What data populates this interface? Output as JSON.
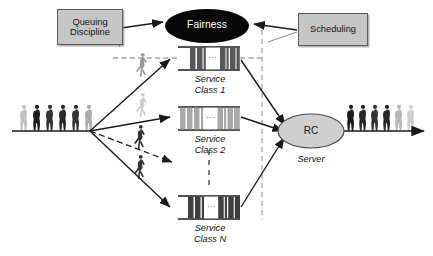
{
  "figure": {
    "title_visible": false,
    "width": 433,
    "height": 256,
    "background": "#ffffff"
  },
  "controls": [
    {
      "id": "queuing-discipline",
      "label": "Queuing\nDiscipline",
      "x": 57,
      "y": 9,
      "w": 64,
      "h": 34,
      "fill": "#c6c6c6",
      "stroke": "#5a5a5a"
    },
    {
      "id": "scheduling",
      "label": "Scheduling",
      "x": 298,
      "y": 13,
      "w": 68,
      "h": 31,
      "fill": "#c6c6c6",
      "stroke": "#5a5a5a"
    }
  ],
  "nodes": {
    "fairness": {
      "label": "Fairness",
      "cx": 207,
      "cy": 26,
      "rx": 42,
      "ry": 17,
      "fill": "#080808",
      "text_color": "#ffffff"
    },
    "server": {
      "label": "RC",
      "sublabel": "Server",
      "cx": 311,
      "cy": 131,
      "rx": 33,
      "ry": 17,
      "fill": "#cfcfcf",
      "stroke": "#4d4d4d",
      "text_color": "#151515"
    }
  },
  "queues": [
    {
      "id": "service-class-1",
      "label_line1": "Service",
      "label_line2": "Class 1",
      "x": 178,
      "y": 47,
      "w": 62,
      "h": 23,
      "cell_fill": "#585858",
      "gap_fill": "#ffffff",
      "ellipsis": "...",
      "rail_stroke": "#1a1a1a"
    },
    {
      "id": "service-class-2",
      "label_line1": "Service",
      "label_line2": "Class 2",
      "x": 178,
      "y": 107,
      "w": 62,
      "h": 23,
      "cell_fill": "#a9a9a9",
      "gap_fill": "#ffffff",
      "ellipsis": "...",
      "rail_stroke": "#1a1a1a"
    },
    {
      "id": "service-class-n",
      "label_line1": "Service",
      "label_line2": "Class N",
      "x": 178,
      "y": 196,
      "w": 62,
      "h": 23,
      "cell_fill": "#3f3f3f",
      "gap_fill": "#ffffff",
      "ellipsis": "...",
      "rail_stroke": "#1a1a1a"
    }
  ],
  "crowds": {
    "inbound": {
      "id": "inbound-crowd",
      "count": 7,
      "baseline_y": 131,
      "start_x": 18,
      "spacing": 14,
      "opacities": [
        0.25,
        0.95,
        0.85,
        0.9,
        0.85,
        0.9,
        0.3
      ]
    },
    "outbound": {
      "id": "outbound-crowd",
      "count": 7,
      "baseline_y": 131,
      "start_x": 345,
      "spacing": 12,
      "opacities": [
        0.95,
        0.9,
        0.85,
        0.9,
        0.85,
        0.28,
        0.2
      ]
    },
    "walkers": [
      {
        "id": "walker-top",
        "x": 141,
        "y": 56,
        "opacity": 0.45,
        "h": 22
      },
      {
        "id": "walker-mid-1",
        "x": 141,
        "y": 96,
        "opacity": 0.22,
        "h": 22
      },
      {
        "id": "walker-mid-2",
        "x": 139,
        "y": 128,
        "opacity": 0.85,
        "h": 22
      },
      {
        "id": "walker-mid-3",
        "x": 139,
        "y": 158,
        "opacity": 0.85,
        "h": 22
      }
    ]
  },
  "edges": [
    {
      "id": "edge-inflow-main",
      "type": "solid",
      "from": "inbound-line-left",
      "to": "split-point"
    },
    {
      "id": "edge-split-to-class1",
      "type": "solid",
      "to": "service-class-1"
    },
    {
      "id": "edge-split-to-class2",
      "type": "solid",
      "to": "service-class-2"
    },
    {
      "id": "edge-split-to-classn",
      "type": "solid",
      "to": "service-class-n"
    },
    {
      "id": "edge-split-dashed",
      "type": "dashed",
      "to": "mid-drop"
    },
    {
      "id": "edge-class1-to-server",
      "type": "solid",
      "from": "service-class-1",
      "to": "server"
    },
    {
      "id": "edge-class2-to-server",
      "type": "solid",
      "from": "service-class-2",
      "to": "server"
    },
    {
      "id": "edge-classn-to-server",
      "type": "solid",
      "from": "service-class-n",
      "to": "server"
    },
    {
      "id": "edge-server-outflow",
      "type": "solid",
      "from": "server",
      "to": "outbound-crowd"
    },
    {
      "id": "edge-queuing-to-fairness",
      "type": "solid",
      "from": "queuing-discipline",
      "to": "fairness"
    },
    {
      "id": "edge-scheduling-to-fairness",
      "type": "solid",
      "from": "scheduling",
      "to": "fairness"
    },
    {
      "id": "edge-queuing-guide",
      "type": "dashed-guide",
      "from": "queuing-discipline",
      "to": "service-class-1"
    },
    {
      "id": "edge-scheduling-guide",
      "type": "dashed-guide",
      "from": "scheduling",
      "to": "service-class-1"
    },
    {
      "id": "edge-vertical-ellipsis",
      "type": "dashed",
      "from": "service-class-2",
      "to": "service-class-n"
    }
  ],
  "colors": {
    "line": "#1a1a1a",
    "box_fill": "#c6c6c6",
    "box_stroke": "#5a5a5a",
    "fairness_fill": "#080808",
    "server_fill": "#cfcfcf",
    "queue_dark": "#585858",
    "queue_light": "#a9a9a9",
    "queue_darkest": "#3f3f3f",
    "background": "#ffffff"
  }
}
